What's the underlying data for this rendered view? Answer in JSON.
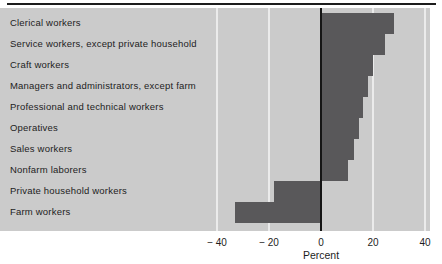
{
  "colors": {
    "panel_bg": "#cbcbcb",
    "bar": "#59585a",
    "gridline": "#ebebeb",
    "zero_line": "#151515",
    "text": "#1d1d1d",
    "top_rule": "#1c1c1c",
    "page_bg": "#ffffff"
  },
  "chart_data": {
    "type": "bar",
    "orientation": "horizontal",
    "title": "",
    "xlabel": "Percent",
    "ylabel": "",
    "categories": [
      "Clerical workers",
      "Service workers, except private household",
      "Craft workers",
      "Managers and administrators, except farm",
      "Professional and technical workers",
      "Operatives",
      "Sales workers",
      "Nonfarm laborers",
      "Private household workers",
      "Farm workers"
    ],
    "values": [
      28,
      24.5,
      20,
      18,
      16,
      14.5,
      12.5,
      10.5,
      -18,
      -33
    ],
    "xlim": [
      -40,
      40
    ],
    "ticks": [
      {
        "value": -40,
        "label": "− 40"
      },
      {
        "value": -20,
        "label": "− 20"
      },
      {
        "value": 0,
        "label": "0"
      },
      {
        "value": 20,
        "label": "20"
      },
      {
        "value": 40,
        "label": "40"
      }
    ],
    "grid": "vertical-gridlines",
    "legend": "none"
  }
}
